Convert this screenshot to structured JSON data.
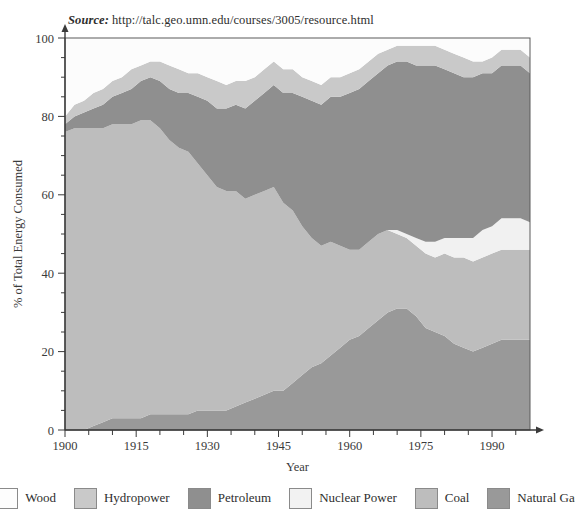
{
  "source": {
    "label": "Source:",
    "url": "http://talc.geo.umn.edu/courses/3005/resource.html"
  },
  "chart_data": {
    "type": "area",
    "title": "",
    "subtitle": "",
    "xlabel": "Year",
    "ylabel": "% of Total Energy Consumed",
    "xlim": [
      1900,
      1998
    ],
    "ylim": [
      0,
      100
    ],
    "grid": false,
    "stacked": true,
    "legend_position": "bottom",
    "xticks": [
      1900,
      1915,
      1930,
      1945,
      1960,
      1975,
      1990
    ],
    "xtick_labels": [
      "1900",
      "1915",
      "1930",
      "1945",
      "1960",
      "1975",
      "1990"
    ],
    "xminor_step": 5,
    "yticks": [
      0,
      20,
      40,
      60,
      80,
      100
    ],
    "ytick_labels": [
      "0",
      "20",
      "40",
      "60",
      "80",
      "100"
    ],
    "yminor_step": 5,
    "x": [
      1900,
      1902,
      1904,
      1906,
      1908,
      1910,
      1912,
      1914,
      1916,
      1918,
      1920,
      1922,
      1924,
      1926,
      1928,
      1930,
      1932,
      1934,
      1936,
      1938,
      1940,
      1942,
      1944,
      1946,
      1948,
      1950,
      1952,
      1954,
      1956,
      1958,
      1960,
      1962,
      1964,
      1966,
      1968,
      1970,
      1972,
      1974,
      1976,
      1978,
      1980,
      1982,
      1984,
      1986,
      1988,
      1990,
      1992,
      1994,
      1996,
      1998
    ],
    "stack_order_bottom_to_top": [
      "Natural Gas",
      "Coal",
      "Nuclear Power",
      "Petroleum",
      "Hydropower",
      "Wood"
    ],
    "series": [
      {
        "name": "Natural Gas",
        "color": "#999999",
        "values": [
          0,
          0,
          0,
          1,
          2,
          3,
          3,
          3,
          3,
          4,
          4,
          4,
          4,
          4,
          5,
          5,
          5,
          5,
          6,
          7,
          8,
          9,
          10,
          10,
          12,
          14,
          16,
          17,
          19,
          21,
          23,
          24,
          26,
          28,
          30,
          31,
          31,
          29,
          26,
          25,
          24,
          22,
          21,
          20,
          21,
          22,
          23,
          23,
          23,
          23
        ],
        "note": "bottom band"
      },
      {
        "name": "Coal",
        "color": "#bdbdbd",
        "values": [
          76,
          77,
          77,
          76,
          75,
          75,
          75,
          75,
          76,
          75,
          73,
          70,
          68,
          67,
          63,
          60,
          57,
          56,
          55,
          52,
          52,
          52,
          52,
          48,
          44,
          38,
          33,
          30,
          29,
          26,
          23,
          22,
          22,
          22,
          21,
          19,
          18,
          18,
          19,
          19,
          21,
          22,
          23,
          23,
          23,
          23,
          23,
          23,
          23,
          23
        ],
        "note": "second from bottom"
      },
      {
        "name": "Nuclear Power",
        "color": "#f1f1f1",
        "values": [
          0,
          0,
          0,
          0,
          0,
          0,
          0,
          0,
          0,
          0,
          0,
          0,
          0,
          0,
          0,
          0,
          0,
          0,
          0,
          0,
          0,
          0,
          0,
          0,
          0,
          0,
          0,
          0,
          0,
          0,
          0,
          0,
          0,
          0,
          0,
          1,
          1,
          2,
          3,
          4,
          4,
          5,
          5,
          6,
          7,
          7,
          8,
          8,
          8,
          7
        ],
        "note": "thin light band appearing after ~1970"
      },
      {
        "name": "Petroleum",
        "color": "#8f8f8f",
        "values": [
          2,
          3,
          4,
          5,
          6,
          7,
          8,
          9,
          10,
          11,
          12,
          13,
          14,
          15,
          17,
          19,
          20,
          21,
          22,
          23,
          24,
          25,
          26,
          28,
          30,
          33,
          35,
          36,
          37,
          38,
          40,
          41,
          41,
          41,
          42,
          43,
          44,
          44,
          45,
          45,
          43,
          42,
          41,
          41,
          40,
          39,
          39,
          39,
          39,
          38
        ],
        "note": "large dark band, middle-upper"
      },
      {
        "name": "Hydropower",
        "color": "#c9c9c9",
        "values": [
          2,
          3,
          3,
          4,
          4,
          4,
          4,
          5,
          4,
          4,
          5,
          6,
          6,
          5,
          6,
          6,
          7,
          6,
          6,
          7,
          6,
          6,
          6,
          6,
          6,
          5,
          5,
          5,
          5,
          5,
          5,
          5,
          5,
          5,
          4,
          4,
          4,
          5,
          5,
          5,
          5,
          5,
          5,
          4,
          3,
          4,
          4,
          4,
          4,
          4
        ],
        "note": "thin band above petroleum"
      },
      {
        "name": "Wood",
        "color": "#fcfcfc",
        "values": [
          20,
          17,
          16,
          14,
          13,
          11,
          10,
          8,
          7,
          6,
          6,
          7,
          8,
          9,
          9,
          10,
          11,
          12,
          11,
          11,
          10,
          8,
          6,
          8,
          8,
          10,
          11,
          12,
          10,
          10,
          9,
          8,
          6,
          4,
          3,
          2,
          2,
          2,
          2,
          2,
          3,
          4,
          5,
          6,
          6,
          5,
          3,
          3,
          3,
          5
        ],
        "note": "top band, fills to 100%"
      }
    ]
  },
  "legend": {
    "items": [
      {
        "label": "Wood",
        "color": "#fdfdfd"
      },
      {
        "label": "Hydropower",
        "color": "#c9c9c9"
      },
      {
        "label": "Petroleum",
        "color": "#8f8f8f"
      },
      {
        "label": "Nuclear Power",
        "color": "#f2f2f2"
      },
      {
        "label": "Coal",
        "color": "#bdbdbd"
      },
      {
        "label": "Natural Gas",
        "color": "#999999"
      }
    ]
  }
}
